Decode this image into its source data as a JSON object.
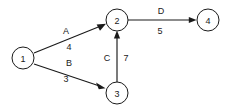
{
  "diagram": {
    "type": "directed-weighted-graph",
    "background_color": "#ffffff",
    "stroke_color": "#1a1a1a",
    "nodes": [
      {
        "id": "1",
        "label": "1",
        "cx": 23,
        "cy": 58,
        "r": 11
      },
      {
        "id": "2",
        "label": "2",
        "cx": 117,
        "cy": 20,
        "r": 11
      },
      {
        "id": "3",
        "label": "3",
        "cx": 117,
        "cy": 93,
        "r": 11
      },
      {
        "id": "4",
        "label": "4",
        "cx": 208,
        "cy": 20,
        "r": 11
      }
    ],
    "edges": [
      {
        "id": "edge-a",
        "from": "1",
        "to": "2",
        "name": "A",
        "weight": "4",
        "name_x": 66,
        "name_y": 31,
        "weight_x": 69,
        "weight_y": 47,
        "x1": 34,
        "y1": 53,
        "x2": 105,
        "y2": 24
      },
      {
        "id": "edge-b",
        "from": "1",
        "to": "3",
        "name": "B",
        "weight": "3",
        "name_x": 69,
        "name_y": 63,
        "weight_x": 66,
        "weight_y": 79,
        "x1": 34,
        "y1": 64,
        "x2": 105,
        "y2": 88
      },
      {
        "id": "edge-c",
        "from": "3",
        "to": "2",
        "name": "C",
        "weight": "7",
        "name_x": 107,
        "name_y": 58,
        "weight_x": 126,
        "weight_y": 58,
        "x1": 117,
        "y1": 82,
        "x2": 117,
        "y2": 31
      },
      {
        "id": "edge-d",
        "from": "2",
        "to": "4",
        "name": "D",
        "weight": "5",
        "name_x": 161,
        "name_y": 11,
        "weight_x": 160,
        "weight_y": 31,
        "x1": 128,
        "y1": 20,
        "x2": 197,
        "y2": 20
      }
    ]
  }
}
